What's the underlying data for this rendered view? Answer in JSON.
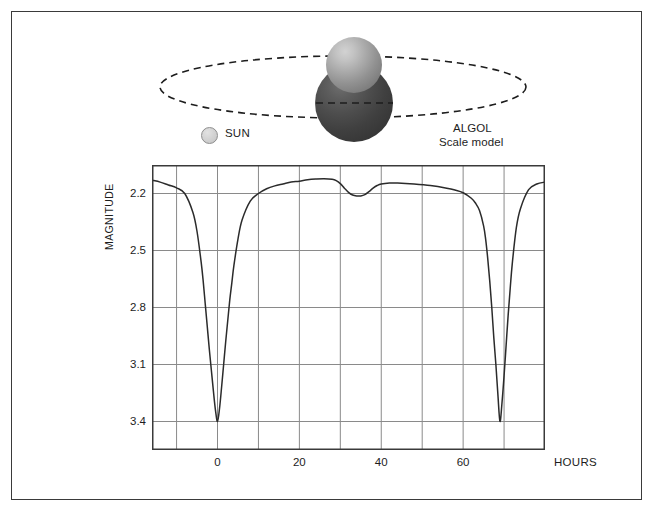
{
  "diagram": {
    "title_algol": "ALGOL",
    "subtitle_algol": "Scale model",
    "legend_sun": "SUN",
    "orbit_style": "dashed-ellipse",
    "bodies": [
      {
        "name": "algol-primary-sphere",
        "color": "#4d4d4d"
      },
      {
        "name": "algol-companion-sphere",
        "color": "#ababab"
      }
    ]
  },
  "chart_data": {
    "type": "line",
    "title": "",
    "subtitle": "",
    "xlabel": "HOURS",
    "ylabel": "MAGNITUDE",
    "x_ticks": [
      0,
      20,
      40,
      60
    ],
    "x_tick_labels": [
      "0",
      "20",
      "40",
      "60"
    ],
    "x_gridlines": [
      -10,
      0,
      10,
      20,
      30,
      40,
      50,
      60,
      70,
      80
    ],
    "xlim": [
      -16,
      80
    ],
    "y_ticks": [
      2.2,
      2.5,
      2.8,
      3.1,
      3.4
    ],
    "y_tick_labels": [
      "2.2",
      "2.5",
      "2.8",
      "3.1",
      "3.4"
    ],
    "ylim": [
      2.05,
      3.55
    ],
    "y_inverted": true,
    "grid": true,
    "legend": "none",
    "line_color": "#2b2b2b",
    "grid_color": "#8a8a8a",
    "series": [
      {
        "name": "Algol light curve",
        "x": [
          -16,
          -14,
          -12,
          -10,
          -8,
          -6,
          -5,
          -4,
          -3.5,
          -3,
          -2.5,
          -2,
          -1.5,
          -1,
          -0.5,
          0,
          0.5,
          1,
          1.5,
          2,
          2.5,
          3,
          3.5,
          4,
          5,
          6,
          8,
          10,
          12,
          14,
          16,
          18,
          20,
          22,
          24,
          26,
          28,
          29,
          30,
          31,
          32,
          33,
          34,
          35,
          36,
          37,
          38,
          39,
          40,
          42,
          44,
          48,
          52,
          56,
          58,
          60,
          62,
          63,
          64,
          65,
          65.5,
          66,
          66.5,
          67,
          67.5,
          68,
          68.5,
          69,
          69.5,
          70,
          70.5,
          71,
          71.5,
          72,
          73,
          74,
          76,
          78,
          80
        ],
        "y": [
          2.13,
          2.14,
          2.155,
          2.17,
          2.2,
          2.3,
          2.4,
          2.56,
          2.66,
          2.78,
          2.9,
          3.02,
          3.13,
          3.24,
          3.34,
          3.4,
          3.33,
          3.22,
          3.1,
          2.98,
          2.87,
          2.76,
          2.67,
          2.58,
          2.44,
          2.34,
          2.24,
          2.2,
          2.175,
          2.16,
          2.15,
          2.14,
          2.135,
          2.128,
          2.124,
          2.122,
          2.125,
          2.132,
          2.148,
          2.172,
          2.194,
          2.208,
          2.213,
          2.213,
          2.206,
          2.19,
          2.172,
          2.158,
          2.15,
          2.145,
          2.145,
          2.15,
          2.158,
          2.172,
          2.182,
          2.196,
          2.225,
          2.25,
          2.29,
          2.37,
          2.44,
          2.54,
          2.66,
          2.8,
          2.96,
          3.1,
          3.26,
          3.4,
          3.3,
          3.16,
          3.0,
          2.84,
          2.7,
          2.57,
          2.38,
          2.28,
          2.18,
          2.15,
          2.14
        ]
      }
    ],
    "annotations": [
      {
        "label": "primary minimum",
        "x": 0,
        "y": 3.4
      },
      {
        "label": "secondary minimum",
        "x": 34.5,
        "y": 2.213
      },
      {
        "label": "primary minimum",
        "x": 69,
        "y": 3.4
      }
    ]
  }
}
